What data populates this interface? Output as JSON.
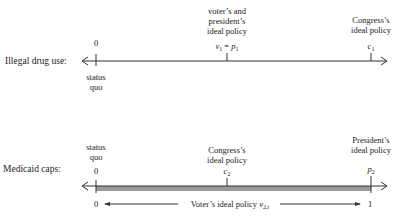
{
  "panel_top": {
    "row_label": "Illegal drug use:",
    "status_quo_value": "0",
    "status_quo_label_1": "status",
    "status_quo_label_2": "quo",
    "voter_president_label_1": "voter’s and",
    "voter_president_label_2": "president’s",
    "voter_president_label_3": "ideal policy",
    "voter_president_symbol_v": "v",
    "voter_president_symbol_v_sub": "1",
    "voter_president_symbol_eq": " = ",
    "voter_president_symbol_p": "p",
    "voter_president_symbol_p_sub": "1",
    "congress_label_1": "Congress’s",
    "congress_label_2": "ideal policy",
    "congress_symbol": "c",
    "congress_symbol_sub": "1"
  },
  "panel_bottom": {
    "row_label": "Medicaid caps:",
    "status_quo_label_1": "status",
    "status_quo_label_2": "quo",
    "status_quo_value": "0",
    "congress_label_1": "Congress’s",
    "congress_label_2": "ideal policy",
    "congress_symbol": "c",
    "congress_symbol_sub": "2",
    "president_label_1": "President’s",
    "president_label_2": "ideal policy",
    "president_symbol": "p",
    "president_symbol_sub": "2",
    "range_left": "0",
    "range_right": "1",
    "voter_range_label": "Voter’s ideal  policy ",
    "voter_range_symbol": "v",
    "voter_range_symbol_sub": "2,t",
    "bar_color": "#9a9a9a"
  }
}
